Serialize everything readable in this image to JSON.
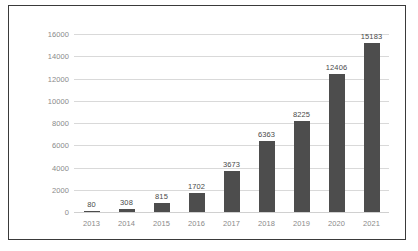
{
  "chart_data": {
    "type": "bar",
    "title": "",
    "subtitle": "",
    "xlabel": "",
    "ylabel": "",
    "categories": [
      "2013",
      "2014",
      "2015",
      "2016",
      "2017",
      "2018",
      "2019",
      "2020",
      "2021"
    ],
    "values": [
      80,
      308,
      815,
      1702,
      3673,
      6363,
      8225,
      12406,
      15183
    ],
    "data_labels": [
      "80",
      "308",
      "815",
      "1702",
      "3673",
      "6363",
      "8225",
      "12406",
      "15183"
    ],
    "ylim": [
      0,
      16000
    ],
    "ytick_labels": [
      "0",
      "2000",
      "4000",
      "6000",
      "8000",
      "10000",
      "12000",
      "14000",
      "16000"
    ],
    "ytick_values": [
      0,
      2000,
      4000,
      6000,
      8000,
      10000,
      12000,
      14000,
      16000
    ],
    "grid": true,
    "legend": false,
    "legend_position": "none",
    "bar_color": "#4d4d4d",
    "gridline_color": "#d9d9d9",
    "tick_label_color": "#8a8a8a",
    "data_label_color": "#4a4a4a",
    "frame_color": "#3a3a3a",
    "background_color": "#ffffff"
  }
}
